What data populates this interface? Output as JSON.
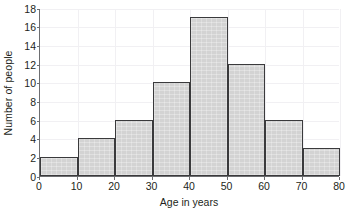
{
  "chart_data": {
    "type": "bar",
    "title": "",
    "subtitle": "",
    "xlabel": "Age in years",
    "ylabel": "Number of people",
    "categories": [
      "0-10",
      "10-20",
      "20-30",
      "30-40",
      "40-50",
      "50-60",
      "60-70",
      "70-80"
    ],
    "bin_edges": [
      0,
      10,
      20,
      30,
      40,
      50,
      60,
      70,
      80
    ],
    "bin_width": 10,
    "values": [
      2,
      4,
      6,
      10,
      17,
      12,
      6,
      3
    ],
    "xlim": [
      0,
      80
    ],
    "ylim": [
      0,
      18
    ],
    "xticks": [
      "0",
      "10",
      "20",
      "30",
      "40",
      "50",
      "60",
      "70",
      "80"
    ],
    "xtick_values": [
      0,
      10,
      20,
      30,
      40,
      50,
      60,
      70,
      80
    ],
    "yticks": [
      "0",
      "2",
      "4",
      "6",
      "8",
      "10",
      "12",
      "14",
      "16",
      "18"
    ],
    "ytick_values": [
      0,
      2,
      4,
      6,
      8,
      10,
      12,
      14,
      16,
      18
    ],
    "grid": true,
    "legend": null,
    "legend_position": "none",
    "annotations": [],
    "total_count": 60,
    "colors": {
      "bar_fill": "#d3d3d3",
      "bar_edge": "#3a3a3c",
      "axis": "#6d6e71",
      "gridline": "#f1f0f3",
      "text": "#231f20",
      "background": "#ffffff"
    }
  }
}
